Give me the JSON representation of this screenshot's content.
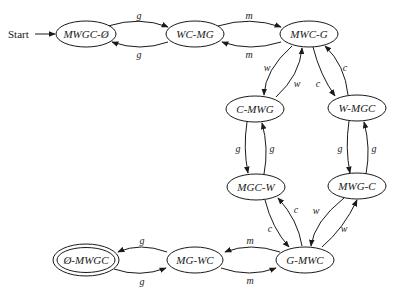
{
  "diagram": {
    "type": "state-transition",
    "start_label": "Start",
    "nodes": {
      "n0": {
        "label": "MWGC-Ø",
        "accepting": false
      },
      "n1": {
        "label": "WC-MG",
        "accepting": false
      },
      "n2": {
        "label": "MWC-G",
        "accepting": false
      },
      "n3": {
        "label": "C-MWG",
        "accepting": false
      },
      "n4": {
        "label": "W-MGC",
        "accepting": false
      },
      "n5": {
        "label": "MGC-W",
        "accepting": false
      },
      "n6": {
        "label": "MWG-C",
        "accepting": false
      },
      "n7": {
        "label": "G-MWC",
        "accepting": false
      },
      "n8": {
        "label": "MG-WC",
        "accepting": false
      },
      "n9": {
        "label": "Ø-MWGC",
        "accepting": true
      }
    },
    "edges": {
      "e0": {
        "from": "MWGC-Ø",
        "to": "WC-MG",
        "label": "g"
      },
      "e1": {
        "from": "WC-MG",
        "to": "MWGC-Ø",
        "label": "g"
      },
      "e2": {
        "from": "WC-MG",
        "to": "MWC-G",
        "label": "m"
      },
      "e3": {
        "from": "MWC-G",
        "to": "WC-MG",
        "label": "m"
      },
      "e4": {
        "from": "MWC-G",
        "to": "C-MWG",
        "label": "w"
      },
      "e5": {
        "from": "C-MWG",
        "to": "MWC-G",
        "label": "w"
      },
      "e6": {
        "from": "MWC-G",
        "to": "W-MGC",
        "label": "c"
      },
      "e7": {
        "from": "W-MGC",
        "to": "MWC-G",
        "label": "c"
      },
      "e8": {
        "from": "C-MWG",
        "to": "MGC-W",
        "label": "g"
      },
      "e9": {
        "from": "MGC-W",
        "to": "C-MWG",
        "label": "g"
      },
      "e10": {
        "from": "W-MGC",
        "to": "MWG-C",
        "label": "g"
      },
      "e11": {
        "from": "MWG-C",
        "to": "W-MGC",
        "label": "g"
      },
      "e12": {
        "from": "MGC-W",
        "to": "G-MWC",
        "label": "c"
      },
      "e13": {
        "from": "G-MWC",
        "to": "MGC-W",
        "label": "c"
      },
      "e14": {
        "from": "MWG-C",
        "to": "G-MWC",
        "label": "w"
      },
      "e15": {
        "from": "G-MWC",
        "to": "MWG-C",
        "label": "w"
      },
      "e16": {
        "from": "G-MWC",
        "to": "MG-WC",
        "label": "m"
      },
      "e17": {
        "from": "MG-WC",
        "to": "G-MWC",
        "label": "m"
      },
      "e18": {
        "from": "MG-WC",
        "to": "Ø-MWGC",
        "label": "g"
      },
      "e19": {
        "from": "Ø-MWGC",
        "to": "MG-WC",
        "label": "g"
      }
    }
  }
}
